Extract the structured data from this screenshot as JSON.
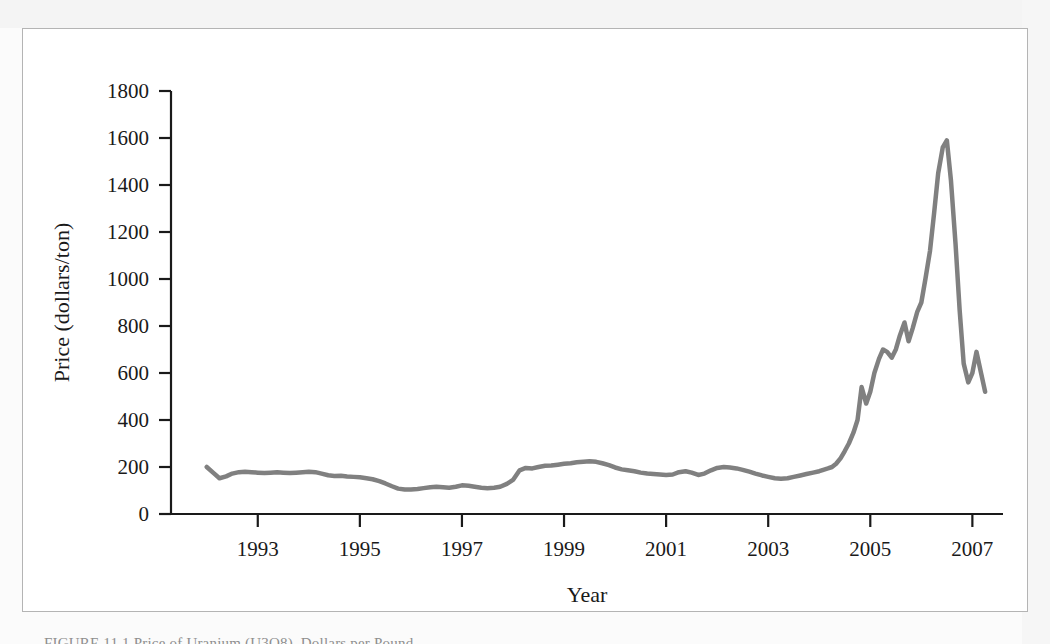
{
  "figure": {
    "caption": "FIGURE 11.1  Price of Uranium (U3O8), Dollars per Pound",
    "background_color": "#ffffff",
    "border_color": "#b4b4b4"
  },
  "chart_data": {
    "type": "line",
    "title": "",
    "xlabel": "Year",
    "ylabel": "Price (dollars/ton)",
    "xlim": [
      1991.3,
      2007.6
    ],
    "ylim": [
      0,
      1800
    ],
    "yticks": [
      0,
      200,
      400,
      600,
      800,
      1000,
      1200,
      1400,
      1600,
      1800
    ],
    "ytick_labels": [
      "0",
      "200",
      "400",
      "600",
      "800",
      "1000",
      "1200",
      "1400",
      "1600",
      "1800"
    ],
    "xticks": [
      1993,
      1995,
      1997,
      1999,
      2001,
      2003,
      2005,
      2007
    ],
    "xtick_labels": [
      "1993",
      "1995",
      "1997",
      "1999",
      "2001",
      "2003",
      "2005",
      "2007"
    ],
    "grid": false,
    "legend": "none",
    "line_color": "#808080",
    "line_width": 4.5,
    "axis_color": "#1a1a1a",
    "series": [
      {
        "name": "Price",
        "x": [
          1992.0,
          1992.13,
          1992.25,
          1992.38,
          1992.5,
          1992.63,
          1992.75,
          1992.88,
          1993.0,
          1993.13,
          1993.25,
          1993.38,
          1993.5,
          1993.63,
          1993.75,
          1993.88,
          1994.0,
          1994.13,
          1994.25,
          1994.38,
          1994.5,
          1994.63,
          1994.75,
          1994.88,
          1995.0,
          1995.13,
          1995.25,
          1995.38,
          1995.5,
          1995.63,
          1995.75,
          1995.88,
          1996.0,
          1996.13,
          1996.25,
          1996.38,
          1996.5,
          1996.63,
          1996.75,
          1996.88,
          1997.0,
          1997.13,
          1997.25,
          1997.38,
          1997.5,
          1997.63,
          1997.75,
          1997.88,
          1998.0,
          1998.13,
          1998.25,
          1998.38,
          1998.5,
          1998.63,
          1998.75,
          1998.88,
          1999.0,
          1999.13,
          1999.25,
          1999.38,
          1999.5,
          1999.63,
          1999.75,
          1999.88,
          2000.0,
          2000.13,
          2000.25,
          2000.38,
          2000.5,
          2000.63,
          2000.75,
          2000.88,
          2001.0,
          2001.13,
          2001.25,
          2001.38,
          2001.5,
          2001.63,
          2001.75,
          2001.88,
          2002.0,
          2002.13,
          2002.25,
          2002.38,
          2002.5,
          2002.63,
          2002.75,
          2002.88,
          2003.0,
          2003.13,
          2003.25,
          2003.38,
          2003.5,
          2003.63,
          2003.75,
          2003.88,
          2004.0,
          2004.08,
          2004.17,
          2004.25,
          2004.33,
          2004.42,
          2004.5,
          2004.58,
          2004.67,
          2004.75,
          2004.83,
          2004.92,
          2005.0,
          2005.08,
          2005.17,
          2005.25,
          2005.33,
          2005.42,
          2005.5,
          2005.58,
          2005.67,
          2005.75,
          2005.83,
          2005.92,
          2006.0,
          2006.08,
          2006.17,
          2006.25,
          2006.33,
          2006.42,
          2006.5,
          2006.58,
          2006.67,
          2006.75,
          2006.83,
          2006.92,
          2007.0,
          2007.08,
          2007.17,
          2007.25
        ],
        "values": [
          200,
          175,
          152,
          160,
          172,
          178,
          180,
          178,
          176,
          174,
          176,
          178,
          176,
          174,
          176,
          178,
          180,
          178,
          172,
          165,
          162,
          163,
          160,
          158,
          156,
          152,
          148,
          140,
          130,
          118,
          108,
          104,
          104,
          106,
          110,
          114,
          116,
          114,
          112,
          116,
          122,
          120,
          116,
          112,
          110,
          112,
          116,
          128,
          145,
          186,
          196,
          194,
          200,
          205,
          206,
          210,
          214,
          216,
          220,
          222,
          224,
          222,
          216,
          208,
          198,
          190,
          186,
          182,
          176,
          172,
          170,
          168,
          166,
          168,
          178,
          182,
          176,
          166,
          172,
          186,
          196,
          200,
          198,
          194,
          188,
          180,
          172,
          164,
          158,
          152,
          150,
          152,
          158,
          164,
          170,
          176,
          182,
          188,
          194,
          200,
          214,
          238,
          268,
          300,
          346,
          400,
          540,
          470,
          520,
          600,
          660,
          700,
          690,
          665,
          700,
          760,
          815,
          735,
          790,
          860,
          900,
          1000,
          1120,
          1280,
          1450,
          1560,
          1590,
          1420,
          1150,
          870,
          640,
          560,
          600,
          690,
          600,
          520
        ]
      }
    ]
  }
}
